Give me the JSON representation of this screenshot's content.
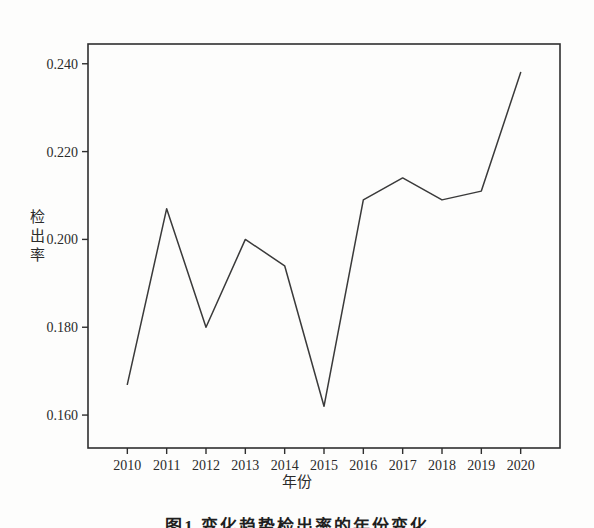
{
  "chart_data": {
    "type": "line",
    "title": "",
    "xlabel": "年份",
    "ylabel": "检出率",
    "categories": [
      "2010",
      "2011",
      "2012",
      "2013",
      "2014",
      "2015",
      "2016",
      "2017",
      "2018",
      "2019",
      "2020"
    ],
    "values": [
      0.167,
      0.207,
      0.18,
      0.2,
      0.194,
      0.162,
      0.209,
      0.214,
      0.209,
      0.211,
      0.238
    ],
    "series": [
      {
        "name": "检出率",
        "values": [
          0.167,
          0.207,
          0.18,
          0.2,
          0.194,
          0.162,
          0.209,
          0.214,
          0.209,
          0.211,
          0.238
        ]
      }
    ],
    "ylim": [
      0.1525,
      0.2445
    ],
    "ytick_labels": [
      "0.240",
      "0.220",
      "0.200",
      "0.180",
      "0.160"
    ],
    "ytick_values": [
      0.24,
      0.22,
      0.2,
      0.18,
      0.16
    ],
    "xtick_labels": [
      "2010",
      "2011",
      "2012",
      "2013",
      "2014",
      "2015",
      "2016",
      "2017",
      "2018",
      "2019",
      "2020"
    ],
    "grid": false,
    "legend": "none",
    "line_color": "#3a3a3a",
    "frame_color": "#2f2f2f",
    "background_color": "#fdfdfc"
  },
  "axes": {
    "y_title_chars": [
      "检",
      "出",
      "率"
    ],
    "y_title": "检出率",
    "x_title": "年份"
  },
  "caption": {
    "text": "图1 变化趋势检出率的年份变化"
  }
}
